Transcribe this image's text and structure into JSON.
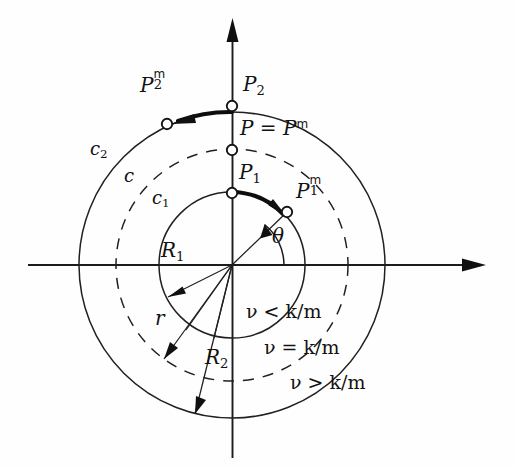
{
  "figure": {
    "type": "math-diagram",
    "background_color": "#fefefe",
    "ink_color": "#141414"
  },
  "axes": {
    "x_axis": {
      "name": "horizontal-axis",
      "arrow": "right"
    },
    "y_axis": {
      "name": "vertical-axis",
      "arrow": "up"
    },
    "origin": {
      "x": 232,
      "y": 265
    }
  },
  "curves": [
    {
      "id": "c1",
      "label": "c",
      "label_sub": "1",
      "style": "solid",
      "radius": 73,
      "label_x": 152,
      "label_y": 196,
      "meaning": "inner circle of radius R1"
    },
    {
      "id": "c",
      "label": "c",
      "label_sub": "",
      "style": "dashed",
      "radius": 116,
      "label_x": 124,
      "label_y": 174,
      "meaning": "intermediate dashed circle of radius r"
    },
    {
      "id": "c2",
      "label": "c",
      "label_sub": "2",
      "style": "solid",
      "radius": 153,
      "label_x": 92,
      "label_y": 148,
      "meaning": "outer circle of radius R2"
    }
  ],
  "points": [
    {
      "id": "P2",
      "base": "P",
      "sub": "2",
      "sup": "",
      "x": 232,
      "y": 106,
      "label_x": 243,
      "label_y": 84,
      "on_curve": "c2"
    },
    {
      "id": "P",
      "base": "P = P",
      "sub": "",
      "sup": "m",
      "x": 232,
      "y": 150,
      "label_x": 243,
      "label_y": 127,
      "on_curve": "c"
    },
    {
      "id": "P1",
      "base": "P",
      "sub": "1",
      "sup": "",
      "x": 232,
      "y": 193,
      "label_x": 240,
      "label_y": 171,
      "on_curve": "c1"
    },
    {
      "id": "P1m",
      "base": "P",
      "sub": "1",
      "sup": "m",
      "x": 287,
      "y": 212,
      "label_x": 296,
      "label_y": 186,
      "on_curve": "c1"
    },
    {
      "id": "P2m",
      "base": "P",
      "sub": "2",
      "sup": "m",
      "x": 167,
      "y": 124,
      "label_x": 140,
      "label_y": 82,
      "on_curve": "c2"
    }
  ],
  "radii": [
    {
      "id": "R1",
      "base": "R",
      "sub": "1",
      "label_x": 161,
      "label_y": 250,
      "angle_deg": 205,
      "target_curve": "c1"
    },
    {
      "id": "r",
      "base": "r",
      "sub": "",
      "label_x": 155,
      "label_y": 316,
      "angle_deg": 234,
      "target_curve": "c"
    },
    {
      "id": "R2",
      "base": "R",
      "sub": "2",
      "label_x": 205,
      "label_y": 357,
      "angle_deg": 256,
      "target_curve": "c2"
    }
  ],
  "angle": {
    "id": "theta",
    "symbol": "θ",
    "label_x": 272,
    "label_y": 235,
    "from_deg": 0,
    "to_deg": 19,
    "arc_radius": 52
  },
  "motion_arcs": [
    {
      "id": "arc-P1-to-P1m",
      "from_point": "P1",
      "to_point": "P1m",
      "direction": "clockwise",
      "curve": "c1"
    },
    {
      "id": "arc-P2-to-P2m",
      "from_point": "P2",
      "to_point": "P2m",
      "direction": "counterclockwise",
      "curve": "c2"
    }
  ],
  "conditions": [
    {
      "id": "nu-less",
      "text": "ν < k/m",
      "x": 246,
      "y": 312,
      "region": "inside c1"
    },
    {
      "id": "nu-equal",
      "text": "ν = k/m",
      "x": 264,
      "y": 348,
      "region": "on c"
    },
    {
      "id": "nu-greater",
      "text": "ν > k/m",
      "x": 290,
      "y": 382,
      "region": "outside c"
    }
  ]
}
